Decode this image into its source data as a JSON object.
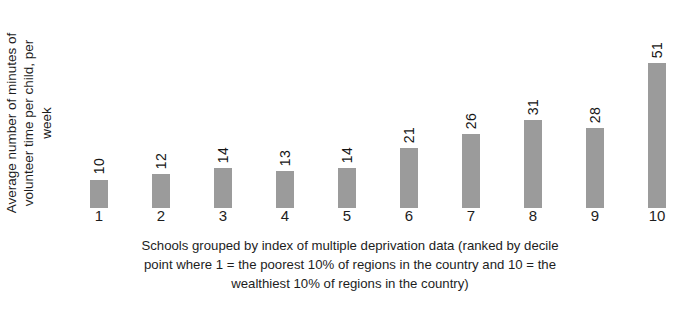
{
  "chart_data": {
    "type": "bar",
    "title": "",
    "subtitle": "",
    "categories": [
      "1",
      "2",
      "3",
      "4",
      "5",
      "6",
      "7",
      "8",
      "9",
      "10"
    ],
    "values": [
      10,
      12,
      14,
      13,
      14,
      21,
      26,
      31,
      28,
      51
    ],
    "data_labels": [
      "10",
      "12",
      "14",
      "13",
      "14",
      "21",
      "26",
      "31",
      "28",
      "51"
    ],
    "ylabel_lines": [
      "Average number of minutes of",
      "volunteer time per child, per",
      "week"
    ],
    "ylabel": "Average number of minutes of volunteer time per child, per week",
    "xlabel_lines": [
      "Schools grouped by index of multiple deprivation data (ranked by decile",
      "point where 1 = the poorest 10% of regions in the country and 10 = the",
      "wealthiest 10% of regions in the country)"
    ],
    "xlabel": "Schools grouped by index of multiple deprivation data (ranked by decile point where 1 = the poorest 10% of regions in the country and 10 = the wealthiest 10% of regions in the country)",
    "ylim": [
      0,
      51
    ],
    "grid": false,
    "axis_lines": false,
    "legend": null,
    "bar_color": "#9b9b9b",
    "text_color": "#1d1d1d",
    "background_color": "#ffffff",
    "data_label_rotation": 90,
    "ylabel_rotation": 90
  }
}
